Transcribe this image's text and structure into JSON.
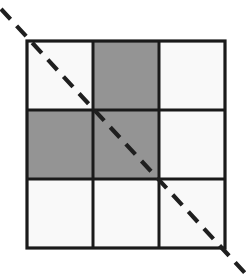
{
  "figure": {
    "canvas": {
      "width": 247,
      "height": 278,
      "background": "#ffffff"
    }
  },
  "grid": {
    "origin_x": 27,
    "origin_y": 41,
    "cell_width": 66,
    "cell_height": 69,
    "rows": 3,
    "cols": 3,
    "border_color": "#1a1a1a",
    "border_width": 3.2,
    "inner_line_width": 3.0,
    "fill_empty": "#f9f9f9",
    "fill_shaded": "#949494",
    "cells": [
      [
        {
          "name": "cell-r1c1",
          "state": "empty",
          "fill": "#f9f9f9"
        },
        {
          "name": "cell-r1c2",
          "state": "shaded",
          "fill": "#949494"
        },
        {
          "name": "cell-r1c3",
          "state": "empty",
          "fill": "#f9f9f9"
        }
      ],
      [
        {
          "name": "cell-r2c1",
          "state": "shaded",
          "fill": "#949494"
        },
        {
          "name": "cell-r2c2",
          "state": "shaded",
          "fill": "#949494"
        },
        {
          "name": "cell-r2c3",
          "state": "empty",
          "fill": "#f9f9f9"
        }
      ],
      [
        {
          "name": "cell-r3c1",
          "state": "empty",
          "fill": "#f9f9f9"
        },
        {
          "name": "cell-r3c2",
          "state": "empty",
          "fill": "#f9f9f9"
        },
        {
          "name": "cell-r3c3",
          "state": "empty",
          "fill": "#f9f9f9"
        }
      ]
    ]
  },
  "diagonal": {
    "name": "dashed-diagonal-line",
    "x1": 1,
    "y1": 9,
    "x2": 245,
    "y2": 273,
    "color": "#1f1f1f",
    "width": 4.2,
    "dash": "14 9",
    "linecap": "butt"
  }
}
